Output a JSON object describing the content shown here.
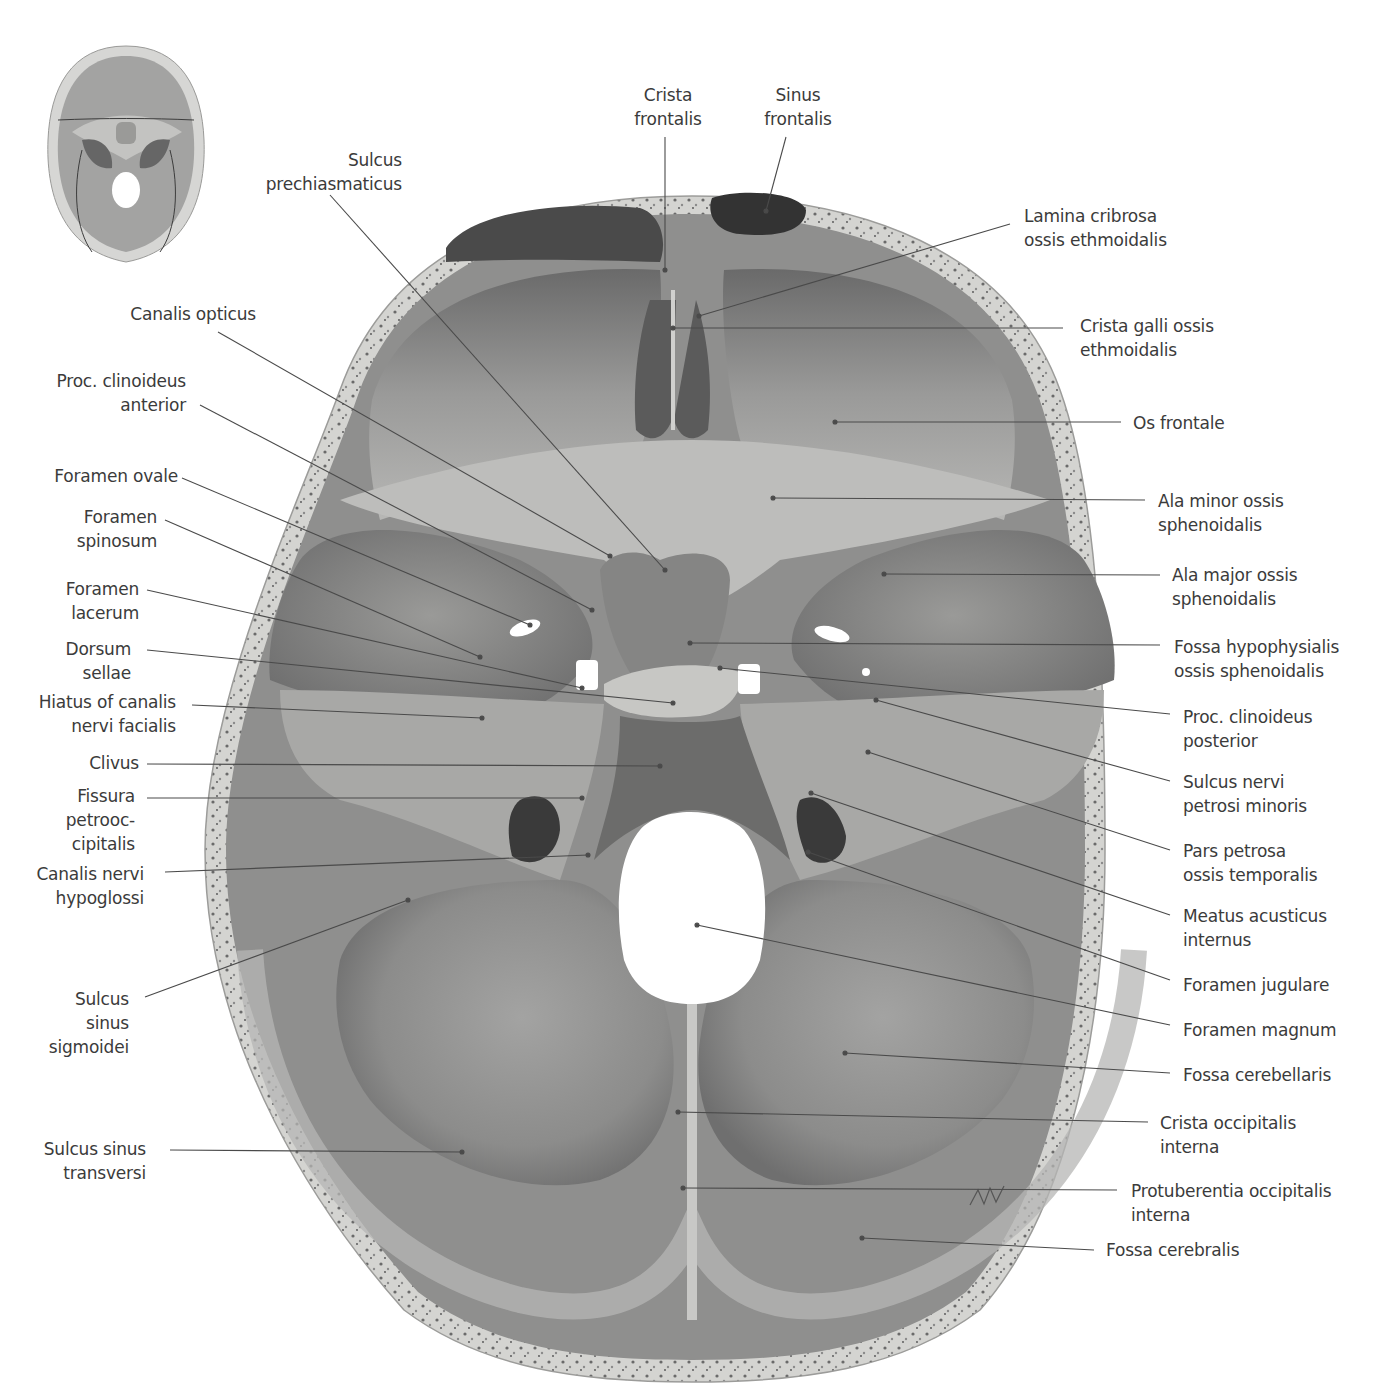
{
  "figure": {
    "colors": {
      "background": "#ffffff",
      "bone_outer": "#d8d8d6",
      "bone_diploe": "#bfbfbc",
      "fossa_dark": "#6e6e6e",
      "fossa_mid": "#8a8a8a",
      "fossa_light": "#a9a9a8",
      "label_text": "#3b3b3b",
      "leader_line": "#4a4a4a"
    },
    "thumbnail": {
      "description": "orientation thumbnail of skull base with suture lines"
    },
    "signature": "signature-mark"
  },
  "labels_left": [
    {
      "id": "sulcus-prechiasmaticus",
      "lines": [
        "Sulcus",
        "prechiasmaticus"
      ],
      "x": 402,
      "y": 148,
      "align": "right",
      "target": [
        665,
        570
      ],
      "from": [
        330,
        195
      ]
    },
    {
      "id": "canalis-opticus",
      "lines": [
        "Canalis opticus"
      ],
      "x": 256,
      "y": 302,
      "align": "right",
      "target": [
        610,
        556
      ],
      "from": [
        218,
        332
      ]
    },
    {
      "id": "proc-clinoideus-anterior",
      "lines": [
        "Proc. clinoideus",
        "anterior"
      ],
      "x": 186,
      "y": 369,
      "align": "right",
      "target": [
        592,
        610
      ],
      "from": [
        200,
        405
      ]
    },
    {
      "id": "foramen-ovale",
      "lines": [
        "Foramen ovale"
      ],
      "x": 178,
      "y": 464,
      "align": "right",
      "target": [
        530,
        625
      ],
      "from": [
        182,
        478
      ]
    },
    {
      "id": "foramen-spinosum",
      "lines": [
        "Foramen",
        "spinosum"
      ],
      "x": 157,
      "y": 505,
      "align": "right",
      "target": [
        480,
        657
      ],
      "from": [
        165,
        520
      ]
    },
    {
      "id": "foramen-lacerum",
      "lines": [
        "Foramen",
        "lacerum"
      ],
      "x": 139,
      "y": 577,
      "align": "right",
      "target": [
        582,
        688
      ],
      "from": [
        147,
        590
      ]
    },
    {
      "id": "dorsum-sellae",
      "lines": [
        "Dorsum",
        "sellae"
      ],
      "x": 131,
      "y": 637,
      "align": "right",
      "target": [
        673,
        703
      ],
      "from": [
        147,
        650
      ]
    },
    {
      "id": "hiatus-canalis-nervi-facialis",
      "lines": [
        "Hiatus of canalis",
        "nervi facialis"
      ],
      "x": 176,
      "y": 690,
      "align": "right",
      "target": [
        482,
        718
      ],
      "from": [
        192,
        705
      ]
    },
    {
      "id": "clivus",
      "lines": [
        "Clivus"
      ],
      "x": 139,
      "y": 751,
      "align": "right",
      "target": [
        660,
        766
      ],
      "from": [
        147,
        764
      ]
    },
    {
      "id": "fissura-petrooccipitalis",
      "lines": [
        "Fissura",
        "petrooc-",
        "cipitalis"
      ],
      "x": 135,
      "y": 784,
      "align": "right",
      "target": [
        582,
        798
      ],
      "from": [
        147,
        798
      ]
    },
    {
      "id": "canalis-nervi-hypoglossi",
      "lines": [
        "Canalis nervi",
        "hypoglossi"
      ],
      "x": 144,
      "y": 862,
      "align": "right",
      "target": [
        588,
        855
      ],
      "from": [
        165,
        872
      ]
    },
    {
      "id": "sulcus-sinus-sigmoidei",
      "lines": [
        "Sulcus",
        "sinus",
        "sigmoidei"
      ],
      "x": 129,
      "y": 987,
      "align": "right",
      "target": [
        408,
        900
      ],
      "from": [
        145,
        997
      ]
    },
    {
      "id": "sulcus-sinus-transversi",
      "lines": [
        "Sulcus sinus",
        "transversi"
      ],
      "x": 146,
      "y": 1137,
      "align": "right",
      "target": [
        462,
        1152
      ],
      "from": [
        170,
        1150
      ]
    }
  ],
  "labels_top": [
    {
      "id": "crista-frontalis",
      "lines": [
        "Crista",
        "frontalis"
      ],
      "x": 668,
      "y": 83,
      "align": "center",
      "target": [
        665,
        270
      ],
      "from": [
        665,
        137
      ]
    },
    {
      "id": "sinus-frontalis",
      "lines": [
        "Sinus",
        "frontalis"
      ],
      "x": 798,
      "y": 83,
      "align": "center",
      "target": [
        766,
        211
      ],
      "from": [
        786,
        137
      ]
    }
  ],
  "labels_right": [
    {
      "id": "lamina-cribrosa",
      "lines": [
        "Lamina cribrosa",
        "ossis ethmoidalis"
      ],
      "x": 1024,
      "y": 204,
      "align": "left",
      "target": [
        699,
        316
      ],
      "from": [
        1010,
        224
      ]
    },
    {
      "id": "crista-galli",
      "lines": [
        "Crista galli ossis",
        "ethmoidalis"
      ],
      "x": 1080,
      "y": 314,
      "align": "left",
      "target": [
        673,
        328
      ],
      "from": [
        1063,
        328
      ]
    },
    {
      "id": "os-frontale",
      "lines": [
        "Os frontale"
      ],
      "x": 1133,
      "y": 411,
      "align": "left",
      "target": [
        835,
        422
      ],
      "from": [
        1121,
        422
      ]
    },
    {
      "id": "ala-minor",
      "lines": [
        "Ala minor ossis",
        "sphenoidalis"
      ],
      "x": 1158,
      "y": 489,
      "align": "left",
      "target": [
        773,
        498
      ],
      "from": [
        1145,
        500
      ]
    },
    {
      "id": "ala-major",
      "lines": [
        "Ala major ossis",
        "sphenoidalis"
      ],
      "x": 1172,
      "y": 563,
      "align": "left",
      "target": [
        884,
        574
      ],
      "from": [
        1160,
        575
      ]
    },
    {
      "id": "fossa-hypophysialis",
      "lines": [
        "Fossa hypophysialis",
        "ossis sphenoidalis"
      ],
      "x": 1174,
      "y": 635,
      "align": "left",
      "target": [
        690,
        643
      ],
      "from": [
        1160,
        645
      ]
    },
    {
      "id": "proc-clinoideus-posterior",
      "lines": [
        "Proc. clinoideus",
        "posterior"
      ],
      "x": 1183,
      "y": 705,
      "align": "left",
      "target": [
        720,
        668
      ],
      "from": [
        1170,
        714
      ]
    },
    {
      "id": "sulcus-nervi-petrosi-minoris",
      "lines": [
        "Sulcus nervi",
        "petrosi minoris"
      ],
      "x": 1183,
      "y": 770,
      "align": "left",
      "target": [
        876,
        700
      ],
      "from": [
        1170,
        781
      ]
    },
    {
      "id": "pars-petrosa",
      "lines": [
        "Pars petrosa",
        "ossis temporalis"
      ],
      "x": 1183,
      "y": 839,
      "align": "left",
      "target": [
        868,
        752
      ],
      "from": [
        1170,
        850
      ]
    },
    {
      "id": "meatus-acusticus-internus",
      "lines": [
        "Meatus acusticus",
        "internus"
      ],
      "x": 1183,
      "y": 904,
      "align": "left",
      "target": [
        811,
        793
      ],
      "from": [
        1170,
        915
      ]
    },
    {
      "id": "foramen-jugulare",
      "lines": [
        "Foramen jugulare"
      ],
      "x": 1183,
      "y": 973,
      "align": "left",
      "target": [
        808,
        852
      ],
      "from": [
        1170,
        980
      ]
    },
    {
      "id": "foramen-magnum",
      "lines": [
        "Foramen magnum"
      ],
      "x": 1183,
      "y": 1018,
      "align": "left",
      "target": [
        697,
        925
      ],
      "from": [
        1170,
        1025
      ]
    },
    {
      "id": "fossa-cerebellaris",
      "lines": [
        "Fossa cerebellaris"
      ],
      "x": 1183,
      "y": 1063,
      "align": "left",
      "target": [
        845,
        1053
      ],
      "from": [
        1170,
        1073
      ]
    },
    {
      "id": "crista-occipitalis-interna",
      "lines": [
        "Crista occipitalis",
        "interna"
      ],
      "x": 1160,
      "y": 1111,
      "align": "left",
      "target": [
        678,
        1112
      ],
      "from": [
        1148,
        1122
      ]
    },
    {
      "id": "protuberentia-occipitalis-interna",
      "lines": [
        "Protuberentia occipitalis",
        "interna"
      ],
      "x": 1131,
      "y": 1179,
      "align": "left",
      "target": [
        683,
        1188
      ],
      "from": [
        1117,
        1190
      ]
    },
    {
      "id": "fossa-cerebralis",
      "lines": [
        "Fossa cerebralis"
      ],
      "x": 1106,
      "y": 1238,
      "align": "left",
      "target": [
        862,
        1238
      ],
      "from": [
        1094,
        1250
      ]
    }
  ]
}
